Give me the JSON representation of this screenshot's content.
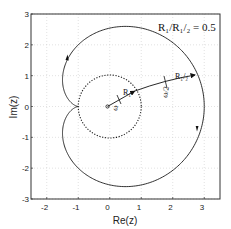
{
  "chart_data": {
    "type": "line",
    "title": "",
    "annotation": "R₁/R₁/₂ = 0.5",
    "xlabel": "Re(z)",
    "ylabel": "Im(z)",
    "xlim": [
      -2.5,
      3.5
    ],
    "ylim": [
      -3,
      3
    ],
    "xticks": [
      -2,
      -1,
      0,
      1,
      2,
      3
    ],
    "yticks": [
      -3,
      -2,
      -1,
      0,
      1,
      2,
      3
    ],
    "grid": true,
    "series": [
      {
        "name": "trajectory",
        "style": "solid",
        "formula": "z(θ) = R1·e^{iθ} + R1/2·e^{iθ/2}, θ ∈ [0, 4π]",
        "R1": 1,
        "R1_2": 2,
        "key_points": [
          {
            "x": 3,
            "y": 0
          },
          {
            "x": 0.5,
            "y": 2.6
          },
          {
            "x": -1,
            "y": 2
          },
          {
            "x": -1,
            "y": 0
          },
          {
            "x": -1,
            "y": -2
          },
          {
            "x": 0.5,
            "y": -2.6
          }
        ]
      },
      {
        "name": "unit circle",
        "style": "dotted",
        "center": [
          0,
          0
        ],
        "radius": 1
      }
    ],
    "vectors": [
      {
        "label": "R₁",
        "from": [
          0,
          0
        ],
        "to": [
          0.866,
          0.5
        ],
        "rate_label": "ω"
      },
      {
        "label": "R₁/₂",
        "from": [
          0.866,
          0.5
        ],
        "to": [
          2.8,
          1.02
        ],
        "rate_label": "ω/2"
      }
    ],
    "direction_arrows": [
      {
        "x": -1.25,
        "y": 1.6,
        "dir": "up"
      },
      {
        "x": 2.9,
        "y": -0.75,
        "dir": "down"
      }
    ]
  },
  "labels": {
    "ratio": "R₁/R₁/₂ = 0.5",
    "xlabel": "Re(z)",
    "ylabel": "Im(z)",
    "r1": "R₁",
    "r12": "R₁/₂",
    "omega": "ω",
    "omega_half": "ω/2",
    "xticks": [
      "-2",
      "-1",
      "0",
      "1",
      "2",
      "3"
    ],
    "yticks": [
      "3",
      "2",
      "1",
      "0",
      "-1",
      "-2",
      "-3"
    ]
  },
  "colors": {
    "line": "#1a1a1a",
    "grid": "#cfcfcf",
    "frame": "#333333"
  }
}
